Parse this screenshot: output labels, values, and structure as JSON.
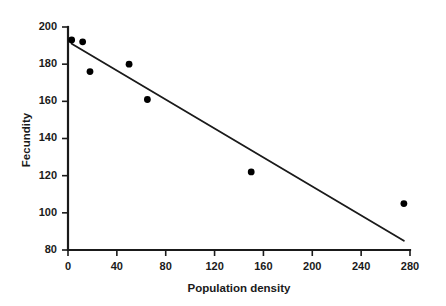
{
  "chart_data": {
    "type": "scatter",
    "title": "",
    "xlabel": "Population density",
    "ylabel": "Fecundity",
    "xlim": [
      0,
      280
    ],
    "ylim": [
      80,
      200
    ],
    "xticks": [
      0,
      40,
      80,
      120,
      160,
      200,
      240,
      280
    ],
    "yticks": [
      80,
      100,
      120,
      140,
      160,
      180,
      200
    ],
    "grid": false,
    "legend": null,
    "series": [
      {
        "name": "observations",
        "marker": "filled-circle",
        "color": "#000000",
        "points": [
          {
            "x": 3,
            "y": 193
          },
          {
            "x": 12,
            "y": 192
          },
          {
            "x": 18,
            "y": 176
          },
          {
            "x": 50,
            "y": 180
          },
          {
            "x": 65,
            "y": 161
          },
          {
            "x": 150,
            "y": 122
          },
          {
            "x": 275,
            "y": 105
          }
        ]
      },
      {
        "name": "regression-line",
        "type": "line",
        "color": "#1a1a1a",
        "points": [
          {
            "x": 3,
            "y": 191
          },
          {
            "x": 275,
            "y": 85
          }
        ]
      }
    ]
  },
  "axes": {
    "x_title": "Population density",
    "y_title": "Fecundity",
    "x_tick_labels": [
      "0",
      "40",
      "80",
      "120",
      "160",
      "200",
      "240",
      "280"
    ],
    "y_tick_labels": [
      "80",
      "100",
      "120",
      "140",
      "160",
      "180",
      "200"
    ]
  },
  "colors": {
    "axis": "#1a1a1a",
    "marker": "#000000",
    "line": "#1a1a1a",
    "background": "#ffffff"
  }
}
